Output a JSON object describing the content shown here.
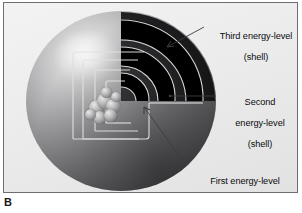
{
  "figure": {
    "caption_letter": "B",
    "panel_background": "#ececed",
    "frame_color": "#6e6e70"
  },
  "diagram": {
    "sphere_label": "electron-cloud-sphere",
    "nucleus_label": "nucleus",
    "shell_outline_color": "#d5d5d6",
    "shell_band_color": "#000000",
    "leader_line_color": "#4a4a4c"
  },
  "labels": [
    {
      "id": "third",
      "text": "Third energy-level\n(shell)",
      "line1": "Third energy-level",
      "line2": "(shell)"
    },
    {
      "id": "second",
      "text": "Second\nenergy-level\n(shell)",
      "line1": "Second",
      "line2": "energy-level",
      "line3": "(shell)"
    },
    {
      "id": "first",
      "text": "First energy-level\n(shell)",
      "line1": "First energy-level",
      "line2": "(shell)"
    }
  ]
}
